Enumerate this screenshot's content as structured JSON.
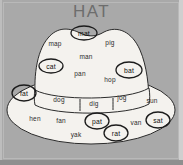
{
  "title": "HAT",
  "colors": {
    "background": "#a9a9a9",
    "hat_fill": "#f4f2ee",
    "outline": "#2b2b2b",
    "title_text": "#6d6d6d",
    "word_text": "#2b2b2b"
  },
  "worksheet": {
    "subject": "hat",
    "instruction_label": "HAT"
  },
  "hat": {
    "parts": [
      {
        "name": "brim",
        "label": "brim"
      },
      {
        "name": "crown",
        "label": "crown"
      },
      {
        "name": "band",
        "label": "hat band"
      }
    ]
  },
  "words": [
    {
      "text": "mat",
      "circled": true,
      "x": 84,
      "y": 33,
      "rx": 13,
      "ry": 7,
      "zone": "crown"
    },
    {
      "text": "map",
      "circled": false,
      "x": 55,
      "y": 43,
      "zone": "crown"
    },
    {
      "text": "pig",
      "circled": false,
      "x": 110,
      "y": 42,
      "zone": "crown"
    },
    {
      "text": "man",
      "circled": false,
      "x": 86,
      "y": 56,
      "zone": "crown"
    },
    {
      "text": "cat",
      "circled": true,
      "x": 51,
      "y": 66,
      "rx": 12,
      "ry": 7,
      "zone": "crown"
    },
    {
      "text": "pan",
      "circled": false,
      "x": 80,
      "y": 73,
      "zone": "crown"
    },
    {
      "text": "hop",
      "circled": false,
      "x": 110,
      "y": 79,
      "zone": "crown"
    },
    {
      "text": "bat",
      "circled": true,
      "x": 129,
      "y": 70,
      "rx": 13,
      "ry": 8,
      "zone": "crown"
    },
    {
      "text": "fat",
      "circled": true,
      "x": 24,
      "y": 93,
      "rx": 12,
      "ry": 8,
      "zone": "brim"
    },
    {
      "text": "dog",
      "circled": false,
      "x": 59,
      "y": 99,
      "zone": "band"
    },
    {
      "text": "dig",
      "circled": false,
      "x": 94,
      "y": 103,
      "zone": "band"
    },
    {
      "text": "jog",
      "circled": false,
      "x": 122,
      "y": 97,
      "zone": "band"
    },
    {
      "text": "sun",
      "circled": false,
      "x": 152,
      "y": 100,
      "zone": "brim"
    },
    {
      "text": "hen",
      "circled": false,
      "x": 35,
      "y": 118,
      "zone": "brim"
    },
    {
      "text": "fan",
      "circled": false,
      "x": 61,
      "y": 120,
      "zone": "brim"
    },
    {
      "text": "pat",
      "circled": true,
      "x": 97,
      "y": 121,
      "rx": 12,
      "ry": 8,
      "zone": "brim"
    },
    {
      "text": "van",
      "circled": false,
      "x": 136,
      "y": 122,
      "zone": "brim"
    },
    {
      "text": "sat",
      "circled": true,
      "x": 158,
      "y": 120,
      "rx": 12,
      "ry": 8,
      "zone": "brim"
    },
    {
      "text": "yak",
      "circled": false,
      "x": 76,
      "y": 134,
      "zone": "brim"
    },
    {
      "text": "rat",
      "circled": true,
      "x": 116,
      "y": 133,
      "rx": 12,
      "ry": 8,
      "zone": "brim"
    }
  ]
}
